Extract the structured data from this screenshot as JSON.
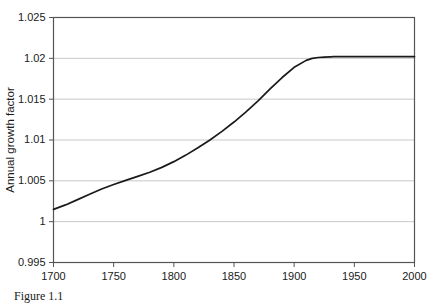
{
  "figure": {
    "caption": "Figure 1.1",
    "background_color": "#ffffff"
  },
  "chart_data": {
    "type": "line",
    "title": "",
    "subtitle": "",
    "xlabel": "",
    "ylabel": "Annual growth factor",
    "xlim": [
      1700,
      2000
    ],
    "ylim": [
      0.995,
      1.025
    ],
    "xticks": [
      1700,
      1750,
      1800,
      1850,
      1900,
      1950,
      2000
    ],
    "xtick_labels": [
      "1700",
      "1750",
      "1800",
      "1850",
      "1900",
      "1950",
      "2000"
    ],
    "yticks": [
      0.995,
      1.0,
      1.005,
      1.01,
      1.015,
      1.02,
      1.025
    ],
    "ytick_labels": [
      "0.995",
      "1",
      "1.005",
      "1.01",
      "1.015",
      "1.02",
      "1.025"
    ],
    "grid": "horizontal",
    "grid_color": "#c8c8c8",
    "legend": "none",
    "line_color": "#1a1a1a",
    "line_width": 1.7,
    "series": [
      {
        "name": "Annual growth factor",
        "x": [
          1700,
          1710,
          1720,
          1730,
          1740,
          1750,
          1760,
          1765,
          1770,
          1780,
          1790,
          1800,
          1810,
          1820,
          1830,
          1840,
          1850,
          1860,
          1870,
          1880,
          1890,
          1900,
          1910,
          1915,
          1920,
          1925,
          1930,
          1933,
          1935,
          1938,
          1940,
          1945,
          1950,
          1960,
          1970,
          1980,
          1990,
          2000
        ],
        "y": [
          1.0015,
          1.00205,
          1.0027,
          1.00335,
          1.004,
          1.00455,
          1.00505,
          1.0053,
          1.00555,
          1.00605,
          1.00665,
          1.00735,
          1.00815,
          1.00905,
          1.01,
          1.01105,
          1.0122,
          1.01345,
          1.0148,
          1.01625,
          1.01765,
          1.0189,
          1.01975,
          1.02,
          1.0201,
          1.02015,
          1.02018,
          1.0202,
          1.0202,
          1.0202,
          1.0202,
          1.0202,
          1.0202,
          1.0202,
          1.0202,
          1.0202,
          1.0202,
          1.0202
        ]
      }
    ],
    "annotations": []
  },
  "axes": {
    "frame_color": "#555555",
    "tick_color": "#555555"
  }
}
